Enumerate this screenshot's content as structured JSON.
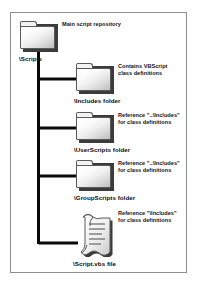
{
  "diagram": {
    "colors": {
      "frame_border": "#8e8e8e",
      "wire": "#0a0a0a",
      "folder_outline": "#5a5a5a",
      "folder_shadow": "#3b3b3b",
      "text": "#0b0b0b",
      "background": "#ffffff"
    },
    "root": {
      "icon": "folder-icon",
      "label": "\\Scripts",
      "annotation": [
        "Main script repository"
      ]
    },
    "children": [
      {
        "icon": "folder-icon",
        "label": "\\Includes folder",
        "annotation": [
          "Contains VBScript",
          "class definitions"
        ]
      },
      {
        "icon": "folder-icon",
        "label": "\\UserScripts folder",
        "annotation": [
          "Reference \"..\\Includes\"",
          "for class definitions"
        ]
      },
      {
        "icon": "folder-icon",
        "label": "\\GroupScripts folder",
        "annotation": [
          "Reference \"..\\Includes\"",
          "for class definitions"
        ]
      },
      {
        "icon": "script-file-icon",
        "label": "\\Script.vbs file",
        "annotation": [
          "Reference \"\\Includes\"",
          "for class definitions"
        ]
      }
    ]
  }
}
